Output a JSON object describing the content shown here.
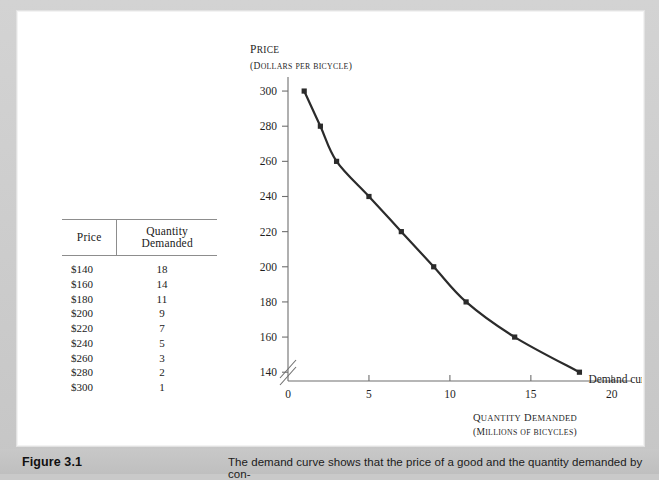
{
  "caption": {
    "figure_number": "Figure 3.1",
    "text": "The demand curve shows that the price of a good and the quantity demanded by con-"
  },
  "table": {
    "headers": {
      "price": "Price",
      "quantity": "Quantity Demanded"
    },
    "rows": [
      {
        "price": "$140",
        "quantity": "18"
      },
      {
        "price": "$160",
        "quantity": "14"
      },
      {
        "price": "$180",
        "quantity": "11"
      },
      {
        "price": "$200",
        "quantity": "9"
      },
      {
        "price": "$220",
        "quantity": "7"
      },
      {
        "price": "$240",
        "quantity": "5"
      },
      {
        "price": "$260",
        "quantity": "3"
      },
      {
        "price": "$280",
        "quantity": "2"
      },
      {
        "price": "$300",
        "quantity": "1"
      }
    ]
  },
  "chart_data": {
    "type": "line",
    "title": "",
    "ylabel": "Price",
    "ylabel_sub": "(Dollars per bicycle)",
    "xlabel": "Quantity Demanded",
    "xlabel_sub": "(Millions of bicycles)",
    "annotation": "Demand curve",
    "x": [
      1,
      2,
      3,
      5,
      7,
      9,
      11,
      14,
      18
    ],
    "y": [
      300,
      280,
      260,
      240,
      220,
      200,
      180,
      160,
      140
    ],
    "xlim": [
      0,
      21
    ],
    "ylim": [
      135,
      308
    ],
    "xticks": [
      0,
      5,
      10,
      15,
      20
    ],
    "yticks": [
      140,
      160,
      180,
      200,
      220,
      240,
      260,
      280,
      300
    ],
    "xtick_labels": [
      "0",
      "5",
      "10",
      "15",
      "20"
    ],
    "ytick_labels": [
      "140",
      "160",
      "180",
      "200",
      "220",
      "240",
      "260",
      "280",
      "300"
    ],
    "grid": false,
    "legend_position": "none",
    "y_axis_break": true,
    "marker": "square",
    "series_color": "#2b2b2b"
  }
}
